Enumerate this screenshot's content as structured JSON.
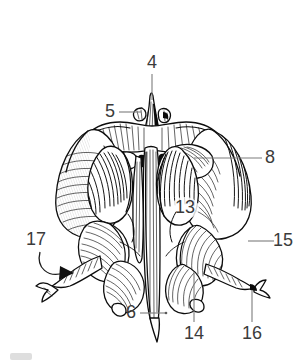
{
  "figure": {
    "view": "posterior",
    "style": "black-and-white engraved line drawing with hatching",
    "background_color": "#ffffff",
    "ink_color": "#0d0d0d",
    "leader_color": "#7c7c7c",
    "label_color": "#3b3b3b",
    "width": 307,
    "height": 364
  },
  "labels": [
    {
      "id": "label-4",
      "text": "4",
      "x": 152,
      "y": 63,
      "anchor": "middle",
      "leader": "vertical-down",
      "leader_path": "M 152 74 L 152 100",
      "target": "crista-galli"
    },
    {
      "id": "label-5",
      "text": "5",
      "x": 110,
      "y": 112,
      "anchor": "middle",
      "leader": "horizontal-right",
      "leader_path": "M 119 112 L 141 112",
      "target": "ala-of-crista-galli"
    },
    {
      "id": "label-8",
      "text": "8",
      "x": 270,
      "y": 158,
      "anchor": "middle",
      "leader": "horizontal-left",
      "leader_path": "M 262 158 L 194 158",
      "target": "orbital-plate-foramen"
    },
    {
      "id": "label-13",
      "text": "13",
      "x": 185,
      "y": 208,
      "anchor": "middle",
      "leader": "none",
      "leader_path": "",
      "target": "middle-nasal-concha"
    },
    {
      "id": "label-15",
      "text": "15",
      "x": 283,
      "y": 241,
      "anchor": "middle",
      "leader": "horizontal-left",
      "leader_path": "M 274 241 L 248 241",
      "target": "ethmoidal-labyrinth-cells"
    },
    {
      "id": "label-17",
      "text": "17",
      "x": 36,
      "y": 240,
      "anchor": "middle",
      "leader": "curved-arrow",
      "leader_path": "M 40 252 C 38 268, 52 276, 68 272",
      "target": "uncinate-process-direction"
    },
    {
      "id": "label-6",
      "text": "6",
      "x": 131,
      "y": 313,
      "anchor": "middle",
      "leader": "horizontal-right",
      "leader_path": "M 140 313 L 166 313",
      "target": "perpendicular-plate"
    },
    {
      "id": "label-14",
      "text": "14",
      "x": 194,
      "y": 334,
      "anchor": "middle",
      "leader": "vertical-up",
      "leader_path": "M 194 322 L 194 272",
      "target": "inferior-turbinate-margin"
    },
    {
      "id": "label-16",
      "text": "16",
      "x": 252,
      "y": 334,
      "anchor": "middle",
      "leader": "vertical-up",
      "leader_path": "M 252 322 L 252 290",
      "target": "ethmoidal-process"
    }
  ]
}
